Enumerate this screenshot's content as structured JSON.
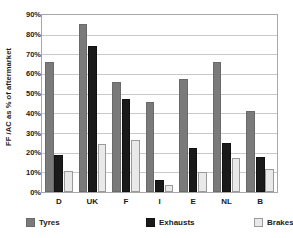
{
  "chart_data": {
    "type": "bar",
    "title": "",
    "subtitle": "",
    "xlabel": "",
    "ylabel": "FF /AC as % of aftermarket",
    "categories": [
      "D",
      "UK",
      "F",
      "I",
      "E",
      "NL",
      "B"
    ],
    "series": [
      {
        "name": "Tyres",
        "color": "#7a7a7a",
        "values": [
          66,
          85.5,
          56,
          46,
          57.5,
          66,
          41
        ]
      },
      {
        "name": "Exhausts",
        "color": "#1a1a1a",
        "values": [
          19,
          74,
          47.5,
          6,
          22.5,
          25,
          18
        ]
      },
      {
        "name": "Brakes",
        "color": "#e9e9e9",
        "values": [
          10.5,
          24.5,
          26.5,
          3.5,
          10,
          17.5,
          11.5
        ]
      }
    ],
    "ylim": [
      0,
      90
    ],
    "ytick_step": 10,
    "ytick_labels": [
      "90%",
      "80%",
      "70%",
      "60%",
      "50%",
      "40%",
      "30%",
      "20%",
      "10%",
      "0%"
    ],
    "ytick_values": [
      90,
      80,
      70,
      60,
      50,
      40,
      30,
      20,
      10,
      0
    ],
    "grid": true,
    "grid_axis": "y",
    "legend_position": "bottom",
    "legend_entries": [
      "Tyres",
      "Exhausts",
      "Brakes"
    ],
    "plot_border_color": "#a8a8a8",
    "gridline_color": "#c9c9c9",
    "background_color": "#ffffff",
    "text_color": "#1a1a1a"
  }
}
